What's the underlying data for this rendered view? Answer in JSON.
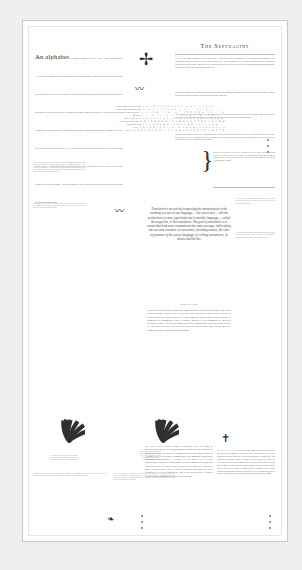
{
  "meta": {
    "background": "#efefef",
    "page_background": "#ffffff",
    "ink": "#3a3a3a",
    "rule_color": "#b9b9b9"
  },
  "article_left": {
    "opener_display": "An alphabet",
    "opener_run": "is a complete standardized set of letters — basic written symbols — each of which roughly represents a phoneme of a spoken language, either at it stands now or as it may have been in the past. There are other systems of writing such as logograms, in which each symbol represents a morpheme, or word, and syllabaries, in which each symbol represents a syllable. It is not always true that a consonant is a distinct alphabet. French uses the same three orthographic as English, but many of the letters can carry diacritics and others use É, Ù or Ü in French, those marks are not considered to create additional letters. However, in languages where diacritics change the core sound value of a letter, it may be treated as a separate letter in its own right — and some alphabets are extended with entirely new characters for sounds foreign to the parent tongue.",
    "column_note": "Letters are the smallest functional unit of writing, and the shapes that carry them have been refined over centuries of hand and press. A standardized order — the alphabetical sequence — makes indexing, sorting and reference possible, and that ordering has itself been remarkably stable across time and across the scripts that descend from the Phoenician model.",
    "footnote": "Orthography is the conventional spelling system of a language; it encompasses not only letter forms but also punctuation, capitalization, word division and the rules that govern where one word ends and another begins."
  },
  "article_right": {
    "title": "The Septuagint",
    "para1": "(LXX) is the name commonly given in the West to the Koine Greek translation of the Hebrew Bible (Tanakh / Old Testament) produced from the third to first centuries BC. The Septuagint Bible includes additional books beyond those found in the Hebrew Bible. Only the Greek version has survived to the present. It is the oldest and most important complete translation of the Hebrew Bible made by the Jews.",
    "para2": "The core sequence of the Septuagint coincides with the Jewish Tanakh, although the order does not always coincide with the modern ordering of the books, which was settled some time later.",
    "para3": "A few books are differently named, yet most significant are the books that do not occur in the Tanakh. These are generally accepted by the Orthodox as scripture, though collected in a text often relegated to an appendix.",
    "para4": "Since there are various editions of the Septuagint, however, there may still be debate about its exact extent and whether individual books belong to the collection. Fragmentary and partial copies survive in papyri, in uncial codices and in later minuscule traditions, so textual criticism of the version remains an active discipline."
  },
  "character_grid": {
    "label_rows": [
      "Hebrew square script, as it stands",
      "with final forms and medial forms",
      "the Samaritan variant",
      "古 archaic",
      "palaeo-Hebrew, as it is",
      "Phoenician, which comes",
      "unifying engraving",
      "Greek",
      "the early"
    ],
    "glyph_rows": [
      "א ב ג ד ה ו ז ח ט י כ ל מ נ ס ע פ צ ק ר ש ת",
      "ך ם ן ף ץ ־ ׃ ׀ ׆ ׳ ״ א ב ג ד ה ו ז ח ט י כ",
      "ࠀ ࠁ ࠂ ࠃ ࠄ ࠅ ࠆ ࠇ ࠈ ࠉ ࠊ ࠋ ࠌ ࠍ ࠎ ࠏ ࠐ ࠑ ࠒ ࠓ ࠔ ࠕ",
      "𐤀 𐤁 𐤂 𐤃 𐤄 𐤅 𐤆 𐤇 𐤈 𐤉 𐤊 𐤋 𐤌 𐤍 𐤎 𐤏 𐤐 𐤑 𐤒 𐤓 𐤔 𐤕",
      "α β γ δ ε ζ η θ ι κ λ μ ν ξ ο π ρ σ τ υ φ χ ψ ω",
      "Α Β Γ Δ Ε Ζ Η Θ Ι Κ Λ Μ Ν Ξ Ο Π Ρ Σ Τ Υ Φ Χ Ψ Ω",
      "ϝ ϛ ϟ ϡ ͳ ϙ ϻ ϸ ͱ ϗ ϐ ϑ ϒ ϕ ϖ ϗ ϙ ϛ ϝ ϟ ϡ ϣ",
      "a b c d e f g h i j k l m n o p q r s t u v w x y z",
      "A B C D E F G H I J K L M N O P Q R S T U V W X Y Z"
    ],
    "brace_note": "Each letter in each row has a direct counterpart in every other, the descent being traceable by name as well as by shape. The transmission runs from Phoenician through Greek to Latin, with the Hebrew square script branching off through the Aramaic chancery hand."
  },
  "pull_quote": {
    "text": "Translation is an activity comprising the interpretation of the meaning of a text in one language — the source text — and the production of a new, equivalent text in another language — called the target text, or the translation. The goal of translation is to ensure that both texts communicate the same message, while taking into account a number of constraints, including context, the rules of grammar of the source language, its writing conventions, its idioms and the like."
  },
  "punctuation_section": {
    "kicker": "Punctuation",
    "body": "is the use of special signs or marks in writing to separate sentences and clauses, and to help clarify meaning. Another closely related use is the insertion of spaces between words, a practice known as word division. In some languages punctuation is used to mark the boundaries of grammatical units, to indicate prosody, or to distinguish the rhetorical weight of a clause. The earliest manuscripts carried almost none; the conventions we now rely on accreted slowly, driven by the needs of readers rather than writers, and were standardized only with the spread of printing."
  },
  "translation_column": {
    "heading": "Translation",
    "body": "Strictly defined, translation is not the same as interpretation; that is, close rendering but no gloss plus the slicing of the individual word, and which is accompanied by meaning beyond the closing of the referred noun. Though glosses are commonly translated as equivalent transposition, it is more or less applied to a literary construction founded by its meaning as a major consideration, and their equivalent denotes a figure of speech whose unit and order expresses a major consideration. There is often confusion regarding the actual definition of a literal translation, and its interaction with a reader's expectation that meaning will survive the crossing."
  },
  "uppercase_column": {
    "heading": "Capitalization",
    "body": "is broadly the distinction in a script between majuscule and minuscule letters, the first term given in the Oxford English Dictionary from the Latin letter meaning 'of a larger size'. The convention generally came to identify a collection of texts, and the word itself is now used in many ways to refer to any form of writing, such as major. Initial capital is a proper noun, refers to a whole book of literary work, and seldom to a wholly specific column. There is often confusion regarding the actual definition of a literal translation, and its interaction with a reader's expectation about what counts as a name."
  },
  "right_margin": {
    "note1": "Letters were created by standards other than their real author; usually a known figure, seen the case of the Samaritan script by Joseph Macpherson.",
    "note2": "A caption set in the margin, where the measure narrows and the type drops a size, so the eye treats it as secondary and returns to the main column without losing its place."
  },
  "ornaments": {
    "dagger": "✢",
    "wave": "〰",
    "brace": "}",
    "cross": "✝",
    "flourish": "❧",
    "burst": "sunburst-fan"
  },
  "folio": {
    "number": ""
  }
}
